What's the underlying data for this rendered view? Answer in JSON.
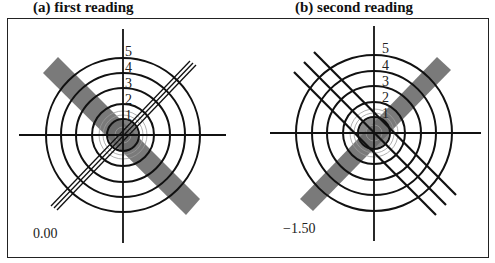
{
  "panels": [
    {
      "title": "(a) first reading",
      "value": "0.00",
      "ring_labels": [
        "1",
        "2",
        "3",
        "4",
        "5"
      ],
      "center": [
        123,
        135
      ],
      "ring_radii": [
        16,
        31,
        47,
        62,
        77
      ],
      "bar_orientation": "top-left to bottom-right",
      "line_orientation": "bottom-left to top-right",
      "line_count": 3,
      "line_spacing": "tight (through center)"
    },
    {
      "title": "(b) second reading",
      "value": "−1.50",
      "ring_labels": [
        "1",
        "2",
        "3",
        "4",
        "5"
      ],
      "center": [
        375,
        133
      ],
      "ring_radii": [
        16,
        31,
        47,
        62,
        78
      ],
      "bar_orientation": "bottom-left to top-right",
      "line_orientation": "top-left to bottom-right",
      "line_count": 3,
      "line_spacing": "wide (offset from center)"
    }
  ],
  "colors": {
    "bar": "#7a7a7a",
    "lines": "#111111",
    "faint_rings": "#9a9a9a",
    "frame": "#222222"
  }
}
